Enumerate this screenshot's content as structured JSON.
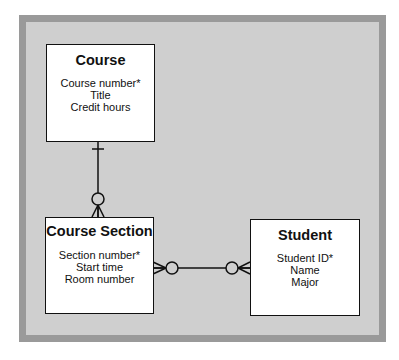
{
  "diagram": {
    "type": "entity-relationship",
    "entities": [
      {
        "id": "course",
        "name": "Course",
        "attributes": [
          "Course number*",
          "Title",
          "Credit hours"
        ]
      },
      {
        "id": "course_section",
        "name": "Course Section",
        "attributes": [
          "Section number*",
          "Start time",
          "Room number"
        ]
      },
      {
        "id": "student",
        "name": "Student",
        "attributes": [
          "Student ID*",
          "Name",
          "Major"
        ]
      }
    ],
    "relationships": [
      {
        "from": "Course",
        "to": "Course Section",
        "from_cardinality": "one (bar)",
        "to_cardinality": "zero or many (circle + crow's foot)"
      },
      {
        "from": "Course Section",
        "to": "Student",
        "from_cardinality": "zero or many (circle + crow's foot)",
        "to_cardinality": "zero or many (circle + crow's foot)"
      }
    ],
    "colors": {
      "frame": "#9a9a9a",
      "panel": "#cfcfcf",
      "box": "#ffffff",
      "line": "#111111"
    }
  }
}
